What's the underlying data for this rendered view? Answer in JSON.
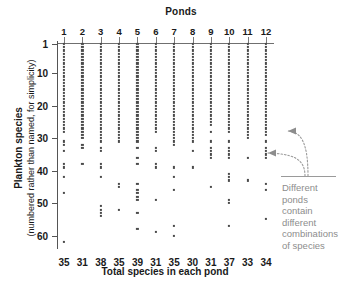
{
  "chart_data": {
    "type": "scatter",
    "title": "Ponds",
    "xlabel": "Total species in each pond",
    "ylabel": "Plankton species",
    "ylabel_sub": "(numbered rather than named, for simplicity)",
    "grid": false,
    "legend": "none",
    "xlim": [
      1,
      12
    ],
    "ylim": [
      1,
      62
    ],
    "yticks": [
      1,
      10,
      20,
      30,
      40,
      50,
      60
    ],
    "categories": [
      "1",
      "2",
      "3",
      "4",
      "5",
      "6",
      "7",
      "8",
      "9",
      "10",
      "11",
      "12"
    ],
    "column_totals": [
      35,
      31,
      38,
      35,
      39,
      31,
      35,
      30,
      31,
      37,
      33,
      34
    ],
    "column_totals_label": "Total species in each pond",
    "series": [
      {
        "name": "Pond 1",
        "total": 35,
        "species_present": [
          1,
          2,
          3,
          4,
          5,
          6,
          7,
          8,
          9,
          10,
          11,
          12,
          13,
          14,
          15,
          16,
          17,
          18,
          19,
          20,
          21,
          22,
          23,
          24,
          25,
          26,
          27,
          28,
          31,
          32,
          34,
          38,
          39,
          42,
          47,
          62
        ]
      },
      {
        "name": "Pond 2",
        "total": 31,
        "species_present": [
          1,
          2,
          3,
          4,
          5,
          6,
          7,
          8,
          9,
          10,
          11,
          12,
          13,
          14,
          15,
          16,
          17,
          18,
          19,
          20,
          21,
          22,
          23,
          24,
          25,
          26,
          27,
          28,
          29,
          30,
          32,
          33,
          38
        ]
      },
      {
        "name": "Pond 3",
        "total": 38,
        "species_present": [
          1,
          2,
          3,
          4,
          5,
          6,
          7,
          8,
          9,
          10,
          11,
          12,
          13,
          14,
          15,
          16,
          17,
          18,
          19,
          20,
          21,
          22,
          23,
          24,
          25,
          26,
          27,
          28,
          29,
          30,
          31,
          33,
          34,
          38,
          39,
          42,
          51,
          52,
          53,
          54
        ]
      },
      {
        "name": "Pond 4",
        "total": 35,
        "species_present": [
          1,
          2,
          3,
          4,
          5,
          6,
          7,
          8,
          9,
          10,
          11,
          12,
          13,
          14,
          15,
          16,
          17,
          18,
          19,
          20,
          21,
          22,
          23,
          24,
          25,
          26,
          27,
          28,
          29,
          30,
          31,
          44,
          45,
          52
        ]
      },
      {
        "name": "Pond 5",
        "total": 39,
        "species_present": [
          1,
          2,
          3,
          4,
          5,
          6,
          7,
          8,
          9,
          10,
          11,
          12,
          13,
          14,
          15,
          16,
          17,
          18,
          19,
          20,
          21,
          22,
          23,
          24,
          25,
          26,
          27,
          28,
          29,
          30,
          31,
          33,
          36,
          38,
          44,
          46,
          47,
          48,
          49,
          53,
          58
        ]
      },
      {
        "name": "Pond 6",
        "total": 31,
        "species_present": [
          1,
          2,
          3,
          4,
          5,
          6,
          7,
          8,
          9,
          10,
          11,
          12,
          13,
          14,
          15,
          16,
          17,
          18,
          19,
          20,
          21,
          22,
          23,
          24,
          25,
          26,
          27,
          28,
          33,
          34,
          38,
          39,
          49,
          59
        ]
      },
      {
        "name": "Pond 7",
        "total": 35,
        "species_present": [
          1,
          2,
          3,
          4,
          5,
          6,
          7,
          8,
          9,
          10,
          11,
          12,
          13,
          14,
          15,
          16,
          17,
          18,
          19,
          20,
          21,
          22,
          23,
          24,
          25,
          26,
          27,
          28,
          29,
          30,
          31,
          32,
          39,
          42,
          46,
          57,
          60
        ]
      },
      {
        "name": "Pond 8",
        "total": 30,
        "species_present": [
          1,
          2,
          3,
          4,
          5,
          6,
          7,
          8,
          9,
          10,
          11,
          12,
          13,
          14,
          15,
          16,
          17,
          18,
          19,
          20,
          21,
          22,
          23,
          24,
          25,
          26,
          27,
          28,
          29,
          30,
          31,
          34,
          39
        ]
      },
      {
        "name": "Pond 9",
        "total": 31,
        "species_present": [
          1,
          2,
          3,
          4,
          5,
          6,
          7,
          8,
          9,
          10,
          11,
          12,
          13,
          14,
          15,
          16,
          17,
          18,
          19,
          20,
          21,
          22,
          23,
          24,
          25,
          26,
          28,
          31,
          33,
          34,
          35,
          36,
          45
        ]
      },
      {
        "name": "Pond 10",
        "total": 37,
        "species_present": [
          1,
          2,
          3,
          4,
          5,
          6,
          7,
          8,
          9,
          10,
          11,
          12,
          13,
          14,
          15,
          16,
          17,
          18,
          19,
          20,
          21,
          22,
          23,
          24,
          25,
          26,
          27,
          28,
          31,
          33,
          34,
          35,
          36,
          41,
          42,
          43,
          49,
          50,
          57
        ]
      },
      {
        "name": "Pond 11",
        "total": 33,
        "species_present": [
          1,
          2,
          3,
          4,
          5,
          6,
          7,
          8,
          9,
          10,
          11,
          12,
          13,
          14,
          15,
          16,
          17,
          18,
          19,
          20,
          21,
          22,
          23,
          24,
          25,
          26,
          27,
          28,
          29,
          30,
          36,
          43
        ]
      },
      {
        "name": "Pond 12",
        "total": 34,
        "species_present": [
          1,
          2,
          3,
          4,
          5,
          6,
          7,
          8,
          9,
          10,
          11,
          12,
          13,
          14,
          15,
          16,
          17,
          18,
          19,
          20,
          21,
          22,
          23,
          24,
          25,
          26,
          27,
          28,
          29,
          31,
          33,
          34,
          35,
          36,
          44,
          46,
          55
        ]
      }
    ],
    "annotation": {
      "text": "Different ponds contain different combinations of species",
      "arrow_targets": [
        "pond 12 at species 28",
        "pond 11 at species 36"
      ]
    }
  },
  "labels": {
    "ponds_title": "Ponds",
    "x_axis_title": "Total species in each pond",
    "y_axis_title": "Plankton species",
    "y_axis_subtitle": "(numbered rather than named, for simplicity)",
    "annotation_text": "Different ponds contain different combinations of species"
  },
  "colors": {
    "dot": "#4a4a4a",
    "axis": "#555555",
    "annotation": "#8d8d8d",
    "background": "#ffffff"
  }
}
